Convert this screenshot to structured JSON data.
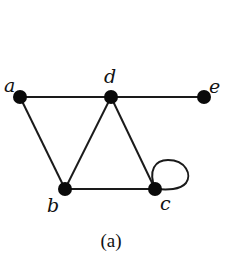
{
  "diagram": {
    "type": "graph",
    "caption": "(a)",
    "colors": {
      "node": "#0a0a0a",
      "edge": "#1a1a1a",
      "background": "#ffffff"
    },
    "nodes": [
      {
        "id": "a",
        "label": "a",
        "x": 20,
        "y": 97,
        "label_x": 4,
        "label_y": 92
      },
      {
        "id": "d",
        "label": "d",
        "x": 111,
        "y": 97,
        "label_x": 104,
        "label_y": 83
      },
      {
        "id": "e",
        "label": "e",
        "x": 204,
        "y": 97,
        "label_x": 209,
        "label_y": 93
      },
      {
        "id": "b",
        "label": "b",
        "x": 65,
        "y": 189,
        "label_x": 47,
        "label_y": 212
      },
      {
        "id": "c",
        "label": "c",
        "x": 155,
        "y": 189,
        "label_x": 160,
        "label_y": 210
      }
    ],
    "edges": [
      {
        "from": "a",
        "to": "d"
      },
      {
        "from": "d",
        "to": "e"
      },
      {
        "from": "a",
        "to": "b"
      },
      {
        "from": "d",
        "to": "b"
      },
      {
        "from": "d",
        "to": "c"
      },
      {
        "from": "b",
        "to": "c"
      },
      {
        "from": "c",
        "to": "c",
        "loop": true
      }
    ]
  }
}
